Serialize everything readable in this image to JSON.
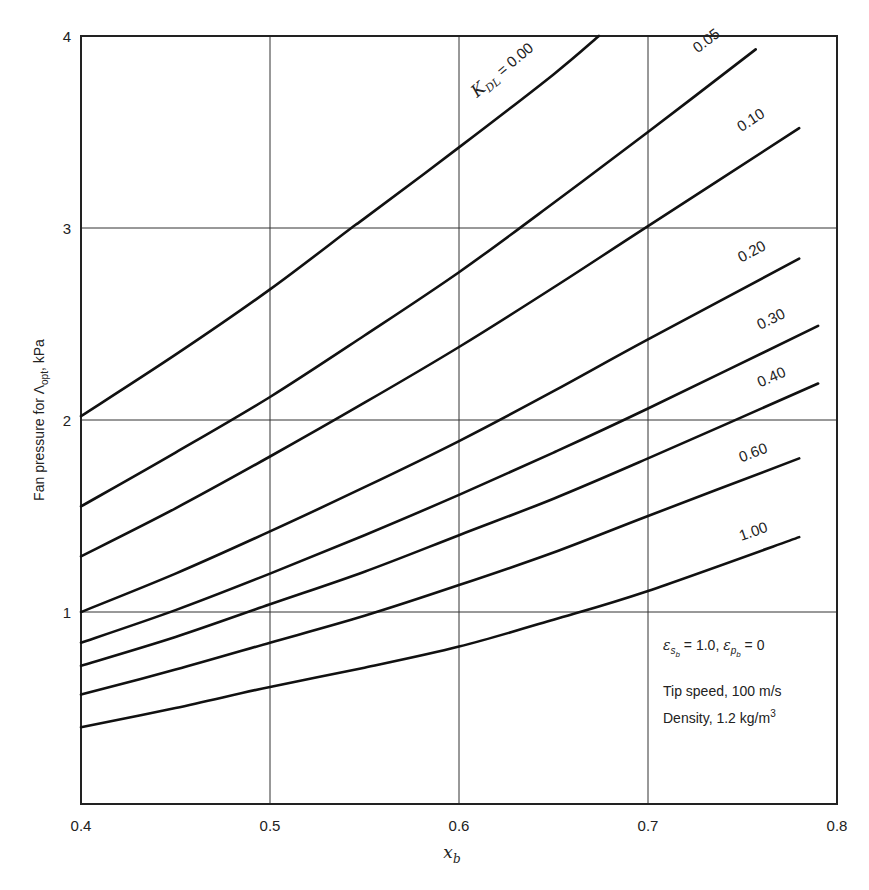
{
  "chart_data": {
    "type": "line",
    "title": "",
    "xlabel": "x_b",
    "ylabel": "Fan pressure for Λopt, kPa",
    "xlim": [
      0.4,
      0.8
    ],
    "ylim": [
      0,
      4
    ],
    "x_ticks": [
      "0.4",
      "0.5",
      "0.6",
      "0.7",
      "0.8"
    ],
    "y_ticks": [
      "1",
      "2",
      "3",
      "4"
    ],
    "grid": true,
    "legend_position": "inline labels at curve ends",
    "parameter_name": "K_DL",
    "series": [
      {
        "name": "K_DL = 0.00",
        "label": "0.00",
        "x": [
          0.4,
          0.45,
          0.5,
          0.543,
          0.55,
          0.6,
          0.65,
          0.674
        ],
        "y": [
          2.02,
          2.34,
          2.68,
          3.0,
          3.05,
          3.42,
          3.8,
          4.0
        ]
      },
      {
        "name": "K_DL = 0.05",
        "label": "0.05",
        "x": [
          0.4,
          0.45,
          0.5,
          0.55,
          0.6,
          0.65,
          0.7,
          0.757
        ],
        "y": [
          1.55,
          1.83,
          2.12,
          2.44,
          2.77,
          3.13,
          3.5,
          3.93
        ]
      },
      {
        "name": "K_DL = 0.10",
        "label": "0.10",
        "x": [
          0.4,
          0.45,
          0.5,
          0.55,
          0.6,
          0.65,
          0.7,
          0.78
        ],
        "y": [
          1.29,
          1.54,
          1.81,
          2.09,
          2.38,
          2.69,
          3.01,
          3.52
        ]
      },
      {
        "name": "K_DL = 0.20",
        "label": "0.20",
        "x": [
          0.4,
          0.45,
          0.5,
          0.55,
          0.6,
          0.65,
          0.7,
          0.78
        ],
        "y": [
          1.0,
          1.2,
          1.42,
          1.65,
          1.89,
          2.15,
          2.42,
          2.84
        ]
      },
      {
        "name": "K_DL = 0.30",
        "label": "0.30",
        "x": [
          0.4,
          0.45,
          0.5,
          0.55,
          0.6,
          0.65,
          0.7,
          0.79
        ],
        "y": [
          0.84,
          1.01,
          1.2,
          1.4,
          1.61,
          1.83,
          2.06,
          2.49
        ]
      },
      {
        "name": "K_DL = 0.40",
        "label": "0.40",
        "x": [
          0.4,
          0.45,
          0.5,
          0.55,
          0.6,
          0.65,
          0.7,
          0.79
        ],
        "y": [
          0.72,
          0.87,
          1.04,
          1.21,
          1.4,
          1.59,
          1.8,
          2.19
        ]
      },
      {
        "name": "K_DL = 0.60",
        "label": "0.60",
        "x": [
          0.4,
          0.45,
          0.5,
          0.55,
          0.6,
          0.65,
          0.7,
          0.78
        ],
        "y": [
          0.57,
          0.7,
          0.84,
          0.98,
          1.14,
          1.31,
          1.5,
          1.8
        ]
      },
      {
        "name": "K_DL = 1.00",
        "label": "1.00",
        "x": [
          0.4,
          0.45,
          0.5,
          0.55,
          0.6,
          0.65,
          0.7,
          0.78
        ],
        "y": [
          0.4,
          0.5,
          0.61,
          0.71,
          0.82,
          0.96,
          1.11,
          1.39
        ]
      }
    ],
    "annotations": [
      "ε_sb = 1.0, ε_pb = 0",
      "Tip speed, 100 m/s",
      "Density, 1.2 kg/m³"
    ]
  },
  "labels": {
    "first_curve_prefix": "K",
    "first_curve_sub": "DL",
    "first_curve_value": " = 0.00",
    "ylabel_main": "Fan pressure for Λ",
    "ylabel_sub": "opt",
    "ylabel_tail": ", kPa",
    "xlabel_main": "x",
    "xlabel_sub": "b",
    "note_eps": "ε",
    "note_eps_sb": "s",
    "note_eps_sb_sub": "b",
    "note_eq1": " = 1.0, ",
    "note_eps_pb": "p",
    "note_eq2": " = 0",
    "note_tip": "Tip speed, 100 m/s",
    "note_density": "Density, 1.2 kg/m",
    "note_density_sup": "3"
  }
}
